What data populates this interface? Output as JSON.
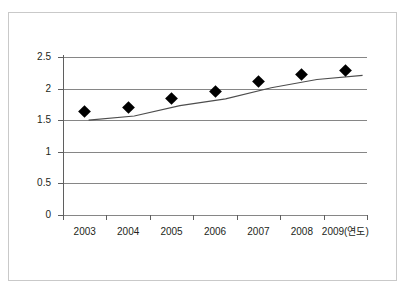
{
  "chart_data": {
    "type": "line",
    "title": "",
    "subtitle": "",
    "xlabel": "",
    "ylabel": "",
    "categories": [
      "2003",
      "2004",
      "2005",
      "2006",
      "2007",
      "2008",
      "2009(연도)"
    ],
    "x_tick_labels": [
      "2003",
      "2004",
      "2005",
      "2006",
      "2007",
      "2008",
      "2009(연도)"
    ],
    "y_tick_labels": [
      "0",
      "0.5",
      "1",
      "1.5",
      "2",
      "2.5"
    ],
    "y_ticks": [
      0,
      0.5,
      1,
      1.5,
      2,
      2.5
    ],
    "values": [
      1.64,
      1.7,
      1.85,
      1.95,
      2.11,
      2.23,
      2.29
    ],
    "series": [
      {
        "name": "",
        "values": [
          1.64,
          1.7,
          1.85,
          1.95,
          2.11,
          2.23,
          2.29
        ],
        "marker": "diamond",
        "marker_color": "#000000",
        "line_color": "#4d4d4d"
      }
    ],
    "ylim": [
      0,
      2.5
    ],
    "xlim_categories": 7,
    "grid": {
      "horizontal": true,
      "vertical": false,
      "color": "#868686"
    },
    "legend": {
      "visible": false,
      "position": "none"
    },
    "axis_line_color": "#5f5f5f",
    "background": "#ffffff",
    "frame_color": "#c9c9c9"
  },
  "figure": {
    "border_label": "chart-border"
  }
}
